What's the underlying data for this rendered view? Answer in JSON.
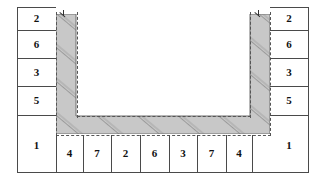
{
  "diagram": {
    "type": "engineering-cross-section",
    "colors": {
      "hatch_fill": "#c8c8c8",
      "hatch_line": "#8a8a8a",
      "outline": "#4a4a4a",
      "dashed": "#555555",
      "label_text": "#111111",
      "background": "#ffffff"
    },
    "left_column": {
      "name": "left-label-column",
      "cells": [
        {
          "label": "2"
        },
        {
          "label": "6"
        },
        {
          "label": "3"
        },
        {
          "label": "5"
        }
      ]
    },
    "right_column": {
      "name": "right-label-column",
      "cells": [
        {
          "label": "2"
        },
        {
          "label": "6"
        },
        {
          "label": "3"
        },
        {
          "label": "5"
        }
      ]
    },
    "bottom_row": {
      "name": "bottom-label-row",
      "cells": [
        {
          "label": "1"
        },
        {
          "label": "4"
        },
        {
          "label": "7"
        },
        {
          "label": "2"
        },
        {
          "label": "6"
        },
        {
          "label": "3"
        },
        {
          "label": "7"
        },
        {
          "label": "4"
        },
        {
          "label": "1"
        }
      ]
    },
    "section": {
      "name": "u-channel-section",
      "description": "U-shaped hatched channel profile",
      "hatch_angle_deg": 40
    }
  }
}
